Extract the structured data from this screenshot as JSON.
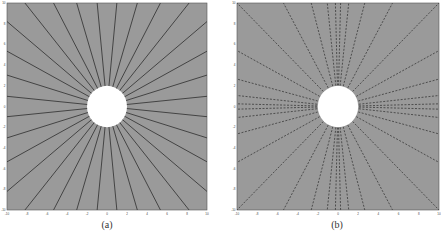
{
  "chart_data": [
    {
      "type": "line",
      "title": "",
      "caption": "(a)",
      "xlabel": "",
      "ylabel": "",
      "xlim": [
        -10,
        10
      ],
      "ylim": [
        -10,
        10
      ],
      "xticks": [
        -10,
        -8,
        -6,
        -4,
        -2,
        0,
        2,
        4,
        6,
        8,
        10
      ],
      "yticks": [
        -10,
        -8,
        -6,
        -4,
        -2,
        0,
        2,
        4,
        6,
        8,
        10
      ],
      "grid": false,
      "background_color": "#9a9a9a",
      "hole": {
        "center": [
          0,
          0
        ],
        "radius": 2,
        "color": "#ffffff"
      },
      "series": [
        {
          "name": "radial rays",
          "style": "solid",
          "color": "#3a3a3a",
          "count": 32,
          "spacing": "uniform"
        }
      ]
    },
    {
      "type": "line",
      "title": "",
      "caption": "(b)",
      "xlabel": "",
      "ylabel": "",
      "xlim": [
        -10,
        10
      ],
      "ylim": [
        -10,
        10
      ],
      "xticks": [
        -10,
        -8,
        -6,
        -4,
        -2,
        0,
        2,
        4,
        6,
        8,
        10
      ],
      "yticks": [
        -10,
        -8,
        -6,
        -4,
        -2,
        0,
        2,
        4,
        6,
        8,
        10
      ],
      "grid": false,
      "background_color": "#9a9a9a",
      "hole": {
        "center": [
          0,
          0
        ],
        "radius": 2,
        "color": "#ffffff"
      },
      "series": [
        {
          "name": "radial rays",
          "style": "dashed",
          "color": "#444444",
          "count": 36,
          "spacing": "clustered near diagonals"
        }
      ]
    }
  ],
  "panels": {
    "a": {
      "caption": "(a)"
    },
    "b": {
      "caption": "(b)"
    }
  }
}
